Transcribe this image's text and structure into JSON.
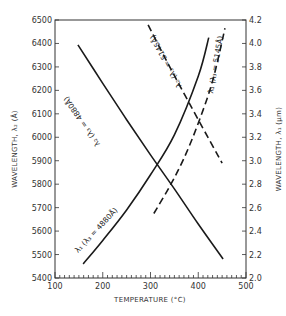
{
  "chart_data": {
    "type": "line",
    "title": "",
    "xlabel": "TEMPERATURE (°C)",
    "ylabel_left": "WAVELENGTH, λ₂ (Å)",
    "ylabel_right": "WAVELENGTH, λ₁ (μm)",
    "xlim": [
      100,
      500
    ],
    "ylim_left": [
      5400,
      6500
    ],
    "ylim_right": [
      2.0,
      4.2
    ],
    "x_ticks": [
      100,
      200,
      300,
      400,
      500
    ],
    "y_ticks_left": [
      5400,
      5500,
      5600,
      5700,
      5800,
      5900,
      6000,
      6100,
      6200,
      6300,
      6400,
      6500
    ],
    "y_ticks_right": [
      2.0,
      2.2,
      2.4,
      2.6,
      2.8,
      3.0,
      3.2,
      3.4,
      3.6,
      3.8,
      4.0,
      4.2
    ],
    "grid": false,
    "series": [
      {
        "name": "λ₂ (λ₃ = 4880 Å)",
        "axis": "left",
        "style": "solid",
        "x": [
          148,
          200,
          250,
          300,
          350,
          400,
          452
        ],
        "y": [
          6394,
          6230,
          6075,
          5925,
          5780,
          5630,
          5481
        ]
      },
      {
        "name": "λ₁ (λ₃ = 4880 Å)",
        "axis": "right",
        "style": "solid",
        "x": [
          159,
          200,
          250,
          300,
          350,
          400,
          422
        ],
        "y": [
          2.12,
          2.32,
          2.58,
          2.88,
          3.22,
          3.72,
          4.05
        ]
      },
      {
        "name": "λ₂ (λ₃ = 5145 Å)",
        "axis": "left",
        "style": "dashed",
        "x": [
          295,
          330,
          360,
          400,
          450
        ],
        "y": [
          6479,
          6340,
          6225,
          6075,
          5890
        ]
      },
      {
        "name": "λ₁ (λ₃ = 5145 Å)",
        "axis": "right",
        "style": "dashed",
        "x": [
          307,
          340,
          370,
          400,
          430,
          456
        ],
        "y": [
          2.55,
          2.78,
          3.02,
          3.32,
          3.68,
          4.13
        ]
      }
    ]
  },
  "labels": {
    "xlabel": "TEMPERATURE (°C)",
    "ylabel_left": "WAVELENGTH, λ₂ (Å)",
    "ylabel_right": "WAVELENGTH, λ₁ (μm)",
    "curve_l2_4880": "λ₂ (λ₃ = 4880Å)",
    "curve_l1_4880": "λ₁ (λ₃ = 4880Å)",
    "curve_l2_5145": "λ₂ (λ₃ = 5145Å)",
    "curve_l1_5145": "λ₁ (λ₃ = 5145Å)"
  }
}
